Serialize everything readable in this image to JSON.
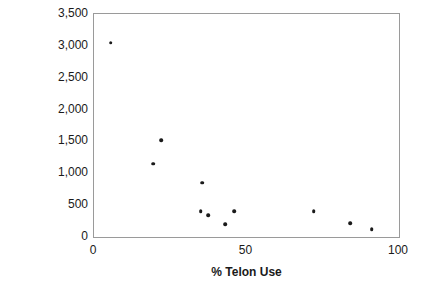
{
  "chart_data": {
    "type": "scatter",
    "title": "",
    "xlabel": "% Telon Use",
    "ylabel": "Effort (hours)",
    "xlim": [
      0,
      100
    ],
    "ylim": [
      0,
      3500
    ],
    "xticks": [
      0,
      50,
      100
    ],
    "xtick_labels": [
      "0",
      "50",
      "100"
    ],
    "yticks": [
      0,
      500,
      1000,
      1500,
      2000,
      2500,
      3000,
      3500
    ],
    "ytick_labels": [
      "0",
      "500",
      "1,000",
      "1,500",
      "2,000",
      "2,500",
      "3,000",
      "3,500"
    ],
    "grid": false,
    "legend": false,
    "marker_color": "#1a1a1a",
    "frame_color": "#9a9a9a",
    "series": [
      {
        "name": "Projects",
        "points": [
          {
            "x": 5.5,
            "y": 3050
          },
          {
            "x": 19.5,
            "y": 1150
          },
          {
            "x": 22.0,
            "y": 1520
          },
          {
            "x": 35.5,
            "y": 855
          },
          {
            "x": 35.0,
            "y": 405
          },
          {
            "x": 37.5,
            "y": 340
          },
          {
            "x": 43.0,
            "y": 200
          },
          {
            "x": 46.0,
            "y": 405
          },
          {
            "x": 72.0,
            "y": 405
          },
          {
            "x": 84.0,
            "y": 215
          },
          {
            "x": 91.0,
            "y": 125
          }
        ]
      }
    ]
  }
}
